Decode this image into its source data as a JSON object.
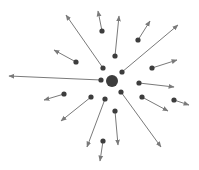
{
  "diagram": {
    "type": "radial-vector-field",
    "colors": {
      "dot": "#3d3d3d",
      "arrow": "#7a7a7a",
      "background": "#ffffff"
    },
    "center": {
      "x": 112,
      "y": 81,
      "r": 6
    },
    "dot_radius": 2.6,
    "vectors": [
      {
        "from": [
          102,
          31
        ],
        "to": [
          98,
          11
        ]
      },
      {
        "from": [
          115,
          56
        ],
        "to": [
          119,
          16
        ]
      },
      {
        "from": [
          138,
          40
        ],
        "to": [
          150,
          21
        ]
      },
      {
        "from": [
          122,
          72
        ],
        "to": [
          178,
          25
        ]
      },
      {
        "from": [
          103,
          68
        ],
        "to": [
          66,
          15
        ]
      },
      {
        "from": [
          76,
          62
        ],
        "to": [
          54,
          50
        ]
      },
      {
        "from": [
          152,
          68
        ],
        "to": [
          177,
          60
        ]
      },
      {
        "from": [
          101,
          80
        ],
        "to": [
          9,
          76
        ]
      },
      {
        "from": [
          139,
          83
        ],
        "to": [
          174,
          87
        ]
      },
      {
        "from": [
          64,
          94
        ],
        "to": [
          44,
          100
        ]
      },
      {
        "from": [
          91,
          97
        ],
        "to": [
          61,
          121
        ]
      },
      {
        "from": [
          105,
          99
        ],
        "to": [
          87,
          147
        ]
      },
      {
        "from": [
          121,
          92
        ],
        "to": [
          161,
          147
        ]
      },
      {
        "from": [
          142,
          97
        ],
        "to": [
          168,
          111
        ]
      },
      {
        "from": [
          174,
          100
        ],
        "to": [
          189,
          105
        ]
      },
      {
        "from": [
          115,
          111
        ],
        "to": [
          118,
          145
        ]
      },
      {
        "from": [
          103,
          141
        ],
        "to": [
          100,
          161
        ]
      }
    ]
  }
}
